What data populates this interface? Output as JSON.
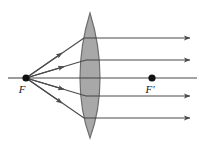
{
  "figure": {
    "width": 199,
    "height": 149,
    "background_color": "#ffffff"
  },
  "labels": {
    "left_focus": "F",
    "right_focus": "F′"
  },
  "colors": {
    "ray_stroke": "#4a4a4a",
    "lens_fill": "#a8a8a8",
    "lens_stroke": "#6e6e6e",
    "point_fill": "#111111",
    "label_fill": "#1a1a1a"
  },
  "geometry": {
    "optical_axis_y": 78,
    "left_focus_point": {
      "x": 26,
      "y": 78
    },
    "right_focus_point": {
      "x": 152,
      "y": 78
    },
    "lens": {
      "center_x": 90,
      "top_apex_y": 13,
      "bottom_apex_y": 138,
      "half_width": 10
    },
    "right_edge_x": 197,
    "incident_rays": [
      {
        "id": "ray-1",
        "from_x": 26,
        "from_y": 78,
        "to_x": 84,
        "to_y": 38,
        "arrow_t": 0.62
      },
      {
        "id": "ray-2",
        "from_x": 26,
        "from_y": 78,
        "to_x": 86,
        "to_y": 60,
        "arrow_t": 0.62
      },
      {
        "id": "ray-3",
        "from_x": 26,
        "from_y": 78,
        "to_x": 80,
        "to_y": 78,
        "arrow_t": 0.62
      },
      {
        "id": "ray-4",
        "from_x": 26,
        "from_y": 78,
        "to_x": 86,
        "to_y": 96,
        "arrow_t": 0.62
      },
      {
        "id": "ray-5",
        "from_x": 26,
        "from_y": 78,
        "to_x": 84,
        "to_y": 118,
        "arrow_t": 0.62
      }
    ],
    "internal_segments": [
      {
        "id": "seg-1",
        "from_x": 84,
        "from_y": 38,
        "to_x": 97,
        "to_y": 38
      },
      {
        "id": "seg-2",
        "from_x": 86,
        "from_y": 60,
        "to_x": 99,
        "to_y": 60
      },
      {
        "id": "seg-3",
        "from_x": 80,
        "from_y": 78,
        "to_x": 100,
        "to_y": 78
      },
      {
        "id": "seg-4",
        "from_x": 86,
        "from_y": 96,
        "to_x": 99,
        "to_y": 96
      },
      {
        "id": "seg-5",
        "from_x": 84,
        "from_y": 118,
        "to_x": 97,
        "to_y": 118
      }
    ],
    "emergent_rays": [
      {
        "id": "out-1",
        "y": 38,
        "from_x": 97,
        "to_x": 190,
        "arrowhead": true
      },
      {
        "id": "out-2",
        "y": 60,
        "from_x": 99,
        "to_x": 190,
        "arrowhead": true
      },
      {
        "id": "out-3",
        "y": 78,
        "from_x": 100,
        "to_x": 197,
        "arrowhead": false
      },
      {
        "id": "out-4",
        "y": 96,
        "from_x": 99,
        "to_x": 190,
        "arrowhead": true
      },
      {
        "id": "out-5",
        "y": 118,
        "from_x": 97,
        "to_x": 190,
        "arrowhead": true
      }
    ]
  }
}
